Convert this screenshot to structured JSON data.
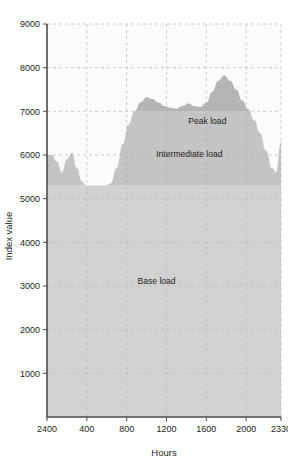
{
  "chart_data": {
    "type": "area",
    "title": "",
    "xlabel": "Hours",
    "ylabel": "Index value",
    "ylim": [
      0,
      9000
    ],
    "y_ticks": [
      1000,
      2000,
      3000,
      4000,
      5000,
      6000,
      7000,
      8000,
      9000
    ],
    "x_ticks": [
      "2400",
      "400",
      "800",
      "1200",
      "1600",
      "2000",
      "2330"
    ],
    "x_tick_positions": [
      0,
      4,
      8,
      12,
      16,
      20,
      23.5
    ],
    "xlim": [
      0,
      23.5
    ],
    "grid": true,
    "legend_position": "none",
    "bands": [
      {
        "name": "Base load",
        "label": "Base load",
        "from": 0,
        "to": 5300,
        "color": "#d2d2d2"
      },
      {
        "name": "Intermediate load",
        "label": "Intermediate load",
        "from": 5300,
        "to": 7000,
        "color": "#c4c4c4"
      },
      {
        "name": "Peak load",
        "label": "Peak load",
        "from": 7000,
        "to": 9000,
        "color": "#b5b5b5"
      }
    ],
    "band_label_positions": [
      {
        "label": "Base load",
        "x": 11.0,
        "y": 3050
      },
      {
        "label": "Intermediate load",
        "x": 14.3,
        "y": 5950
      },
      {
        "label": "Peak load",
        "x": 16.1,
        "y": 6700
      }
    ],
    "series": [
      {
        "name": "Load curve",
        "fill_color": "#c9c9c9",
        "x": [
          0.0,
          0.5,
          1.0,
          1.5,
          2.0,
          2.5,
          3.0,
          3.5,
          4.0,
          4.6,
          5.2,
          5.8,
          6.4,
          7.0,
          7.6,
          8.2,
          8.8,
          9.4,
          10.0,
          10.6,
          11.2,
          11.8,
          12.4,
          13.0,
          13.6,
          14.2,
          14.8,
          15.4,
          16.0,
          16.6,
          17.2,
          17.8,
          18.4,
          19.0,
          19.6,
          20.2,
          20.8,
          21.4,
          22.0,
          22.6,
          23.0,
          23.5
        ],
        "y": [
          6000,
          6000,
          5850,
          5600,
          5900,
          6050,
          5700,
          5400,
          5300,
          5300,
          5300,
          5300,
          5350,
          5700,
          6250,
          6700,
          7000,
          7200,
          7320,
          7280,
          7200,
          7120,
          7080,
          7060,
          7120,
          7180,
          7120,
          7100,
          7200,
          7450,
          7700,
          7820,
          7700,
          7500,
          7250,
          7050,
          6800,
          6500,
          6100,
          5700,
          5600,
          6300
        ]
      }
    ],
    "baseline_value": 5300,
    "peak_value": 7820,
    "axis_color": "#4d4d4d",
    "grid_color": "#b9b9b9",
    "text_color": "#231f20"
  },
  "figure": {
    "top_strip_text": ""
  }
}
